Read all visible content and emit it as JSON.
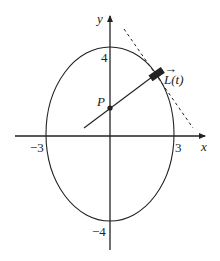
{
  "diagram": {
    "axes": {
      "x_label": "x",
      "y_label": "y"
    },
    "ticks": {
      "x_neg": "−3",
      "x_pos": "3",
      "y_pos": "4",
      "y_neg": "−4"
    },
    "ellipse": {
      "semi_x": 3,
      "semi_y": 4,
      "center": [
        0,
        0
      ]
    },
    "point_label": "P",
    "vector_label": "L(t)",
    "vector_arrow": "→",
    "colors": {
      "stroke": "#222222",
      "background": "#ffffff"
    }
  }
}
